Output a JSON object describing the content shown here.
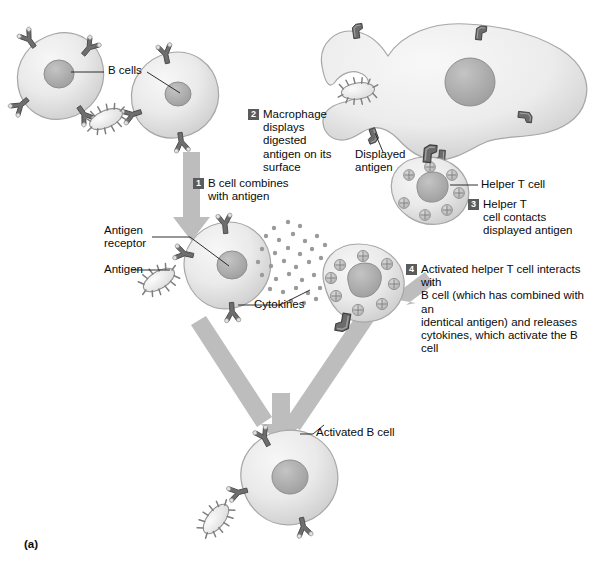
{
  "figure": {
    "panel_letter": "(a)",
    "background_color": "#ffffff",
    "cell_fill": "#e8e8e8",
    "cell_stroke": "#9a9a9a",
    "nucleus_fill": "#b0b0b0",
    "receptor_color": "#6e6e6e",
    "arrow_color": "#b9b9b9",
    "badge_color": "#5b5b5b",
    "text_color": "#0b0b0b"
  },
  "labels": {
    "b_cells": "B cells",
    "displayed_antigen": "Displayed\nantigen",
    "helper_t_cell": "Helper T cell",
    "antigen_receptor": "Antigen\nreceptor",
    "antigen": "Antigen",
    "cytokines": "Cytokines",
    "activated_b_cell": "Activated B cell"
  },
  "steps": [
    {
      "number": "1",
      "text": "B cell combines\nwith antigen"
    },
    {
      "number": "2",
      "text": "Macrophage\ndisplays digested\nantigen on its\nsurface"
    },
    {
      "number": "3",
      "text": "Helper T\ncell contacts\ndisplayed antigen"
    },
    {
      "number": "4",
      "text": "Activated helper T cell interacts with\nB cell (which has combined with an\nidentical antigen) and releases\ncytokines, which activate the B cell"
    }
  ],
  "cells": {
    "b_cell_top_left": "B cell with Y-shaped antigen receptors",
    "b_cell_top_right": "B cell binding a free antigen",
    "macrophage": "Macrophage engulfing and displaying digested antigen",
    "helper_t_cell_upper": "Helper T cell contacting displayed antigen",
    "helper_t_cell_lower": "Activated helper T cell releasing cytokines",
    "b_cell_middle": "B cell combined with antigen via antigen receptor",
    "activated_b_cell": "Activated B cell at bottom"
  }
}
